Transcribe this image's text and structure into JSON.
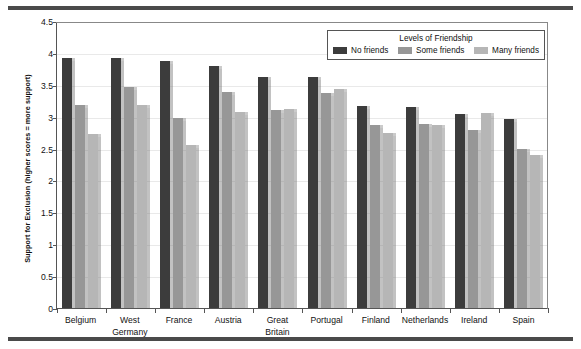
{
  "chart_data": {
    "type": "bar",
    "title": "",
    "xlabel": "",
    "ylabel": "Support for Exclusion (higher scores = more support)",
    "ylim": [
      0,
      4.5
    ],
    "yticks": [
      "0",
      "0.5",
      "1",
      "1.5",
      "2",
      "2.5",
      "3",
      "3.5",
      "4",
      "4.5"
    ],
    "ytick_values": [
      0,
      0.5,
      1,
      1.5,
      2,
      2.5,
      3,
      3.5,
      4,
      4.5
    ],
    "grid": true,
    "legend_position": "top-right",
    "legend_title": "Levels of Friendship",
    "categories": [
      "Belgium",
      "West Germany",
      "France",
      "Austria",
      "Great Britain",
      "Portugal",
      "Finland",
      "Netherlands",
      "Ireland",
      "Spain"
    ],
    "category_lines": [
      [
        "Belgium"
      ],
      [
        "West",
        "Germany"
      ],
      [
        "France"
      ],
      [
        "Austria"
      ],
      [
        "Great",
        "Britain"
      ],
      [
        "Portugal"
      ],
      [
        "Finland"
      ],
      [
        "Netherlands"
      ],
      [
        "Ireland"
      ],
      [
        "Spain"
      ]
    ],
    "series": [
      {
        "name": "No friends",
        "color": "#3c3c3c",
        "values": [
          3.92,
          3.92,
          3.88,
          3.79,
          3.63,
          3.63,
          3.16,
          3.15,
          3.04,
          2.96
        ]
      },
      {
        "name": "Some friends",
        "color": "#979797",
        "values": [
          3.18,
          3.46,
          2.98,
          3.38,
          3.1,
          3.37,
          2.87,
          2.88,
          2.79,
          2.5
        ]
      },
      {
        "name": "Many friends",
        "color": "#b6b6b6",
        "values": [
          2.73,
          3.19,
          2.55,
          3.07,
          3.12,
          3.43,
          2.74,
          2.87,
          3.06,
          2.4
        ]
      }
    ]
  }
}
